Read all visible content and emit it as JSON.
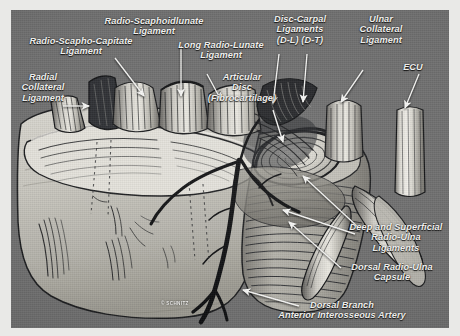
{
  "figure": {
    "kind": "anatomical-illustration",
    "background_color": "#6e6e6e",
    "border_color": "#f2f2f0",
    "ink_color": "#17181a",
    "label_color": "#f4f4f2",
    "credit": "© SCHNITZ"
  },
  "labels": [
    {
      "id": "radio-scapholunate-ligament",
      "text": "Radio-Scaphoidlunate\nLigament"
    },
    {
      "id": "radio-scapho-capitate-ligament",
      "text": "Radio-Scapho-Capitate\nLigament"
    },
    {
      "id": "radial-collateral-ligament",
      "text": "Radial\nCollateral\nLigament"
    },
    {
      "id": "long-radio-lunate-ligament",
      "text": "Long Radio-Lunate\nLigament"
    },
    {
      "id": "articular-disc",
      "text": "Articular\nDisc\n(Fibrocartilage)"
    },
    {
      "id": "disc-carpal-ligaments",
      "text": "Disc-Carpal\nLigaments\n(D-L)  (D-T)"
    },
    {
      "id": "ulnar-collateral-ligament",
      "text": "Ulnar\nCollateral\nLigament"
    },
    {
      "id": "ecu",
      "text": "ECU"
    },
    {
      "id": "deep-superficial-radio-ulna-ligaments",
      "text": "Deep and Superficial\nRadio-Ulna\nLigaments"
    },
    {
      "id": "dorsal-radio-ulna-capsule",
      "text": "Dorsal Radio-Ulna\nCapsule"
    },
    {
      "id": "dorsal-branch-anterior-interosseous-artery",
      "text": "Dorsal Branch\nAnterior Interosseous Artery"
    }
  ]
}
